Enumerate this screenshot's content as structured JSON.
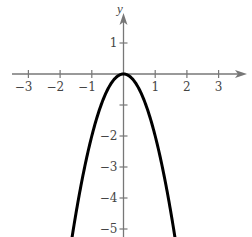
{
  "chart_data": {
    "type": "line",
    "title": "",
    "function": "y = -2x^2",
    "xlabel": "",
    "ylabel": "y",
    "xlim": [
      -3.5,
      3.9
    ],
    "ylim": [
      -5.2,
      2.3
    ],
    "grid": false,
    "legend": null,
    "x_ticks": [
      -3,
      -2,
      -1,
      1,
      2,
      3
    ],
    "x_tick_labels": [
      "−3",
      "−2",
      "−1",
      "1",
      "2",
      "3"
    ],
    "y_ticks": [
      1,
      -1,
      -2,
      -3,
      -4,
      -5
    ],
    "y_tick_labels": [
      "1",
      "",
      "−2",
      "−3",
      "−4",
      "−5"
    ],
    "series": [
      {
        "name": "parabola",
        "x": [
          -1.6,
          -1.5,
          -1.25,
          -1,
          -0.75,
          -0.5,
          -0.25,
          0,
          0.25,
          0.5,
          0.75,
          1,
          1.25,
          1.5,
          1.6
        ],
        "y": [
          -5.12,
          -4.5,
          -3.125,
          -2,
          -1.125,
          -0.5,
          -0.125,
          0,
          -0.125,
          -0.5,
          -1.125,
          -2,
          -3.125,
          -4.5,
          -5.12
        ]
      }
    ],
    "colors": {
      "axis": "#777777",
      "curve": "#000000",
      "text": "#444444"
    }
  }
}
